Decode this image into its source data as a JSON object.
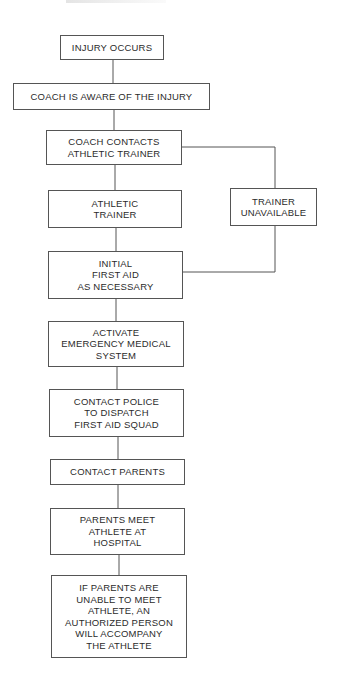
{
  "flowchart": {
    "nodes": [
      {
        "id": "injury-occurs",
        "label": "INJURY OCCURS"
      },
      {
        "id": "coach-aware",
        "label": "COACH IS AWARE OF THE INJURY"
      },
      {
        "id": "coach-contacts",
        "label": "COACH CONTACTS\nATHLETIC TRAINER"
      },
      {
        "id": "athletic-trainer",
        "label": "ATHLETIC\nTRAINER"
      },
      {
        "id": "trainer-unavailable",
        "label": "TRAINER\nUNAVAILABLE"
      },
      {
        "id": "initial-first-aid",
        "label": "INITIAL\nFIRST AID\nAS NECESSARY"
      },
      {
        "id": "activate-ems",
        "label": "ACTIVATE\nEMERGENCY MEDICAL\nSYSTEM"
      },
      {
        "id": "contact-police",
        "label": "CONTACT POLICE\nTO DISPATCH\nFIRST AID SQUAD"
      },
      {
        "id": "contact-parents",
        "label": "CONTACT PARENTS"
      },
      {
        "id": "parents-meet",
        "label": "PARENTS MEET\nATHLETE AT\nHOSPITAL"
      },
      {
        "id": "authorized-person",
        "label": "IF PARENTS ARE\nUNABLE TO MEET\nATHLETE, AN\nAUTHORIZED PERSON\nWILL ACCOMPANY\nTHE ATHLETE"
      }
    ],
    "edges": [
      {
        "from": "injury-occurs",
        "to": "coach-aware"
      },
      {
        "from": "coach-aware",
        "to": "coach-contacts"
      },
      {
        "from": "coach-contacts",
        "to": "athletic-trainer"
      },
      {
        "from": "coach-contacts",
        "to": "trainer-unavailable"
      },
      {
        "from": "athletic-trainer",
        "to": "initial-first-aid"
      },
      {
        "from": "trainer-unavailable",
        "to": "initial-first-aid"
      },
      {
        "from": "initial-first-aid",
        "to": "activate-ems"
      },
      {
        "from": "activate-ems",
        "to": "contact-police"
      },
      {
        "from": "contact-police",
        "to": "contact-parents"
      },
      {
        "from": "contact-parents",
        "to": "parents-meet"
      },
      {
        "from": "parents-meet",
        "to": "authorized-person"
      }
    ]
  }
}
